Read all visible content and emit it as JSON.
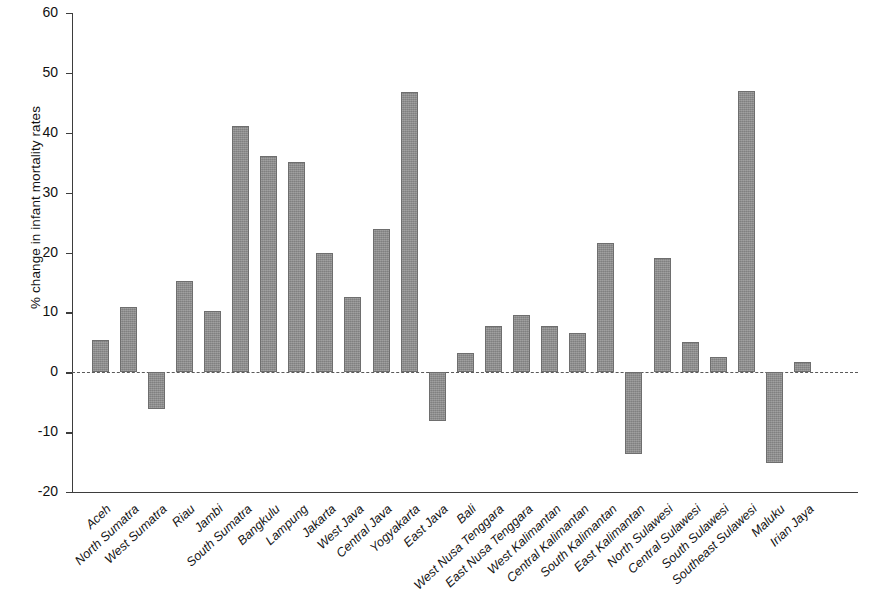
{
  "chart_data": {
    "type": "bar",
    "title": "",
    "subtitle": "",
    "xlabel": "",
    "ylabel": "% change in infant mortality rates",
    "ylim": [
      -20,
      60
    ],
    "ytick_labels": [
      "60",
      "50",
      "40",
      "30",
      "20",
      "10",
      "0",
      "-10",
      "-20"
    ],
    "yticks": [
      60,
      50,
      40,
      30,
      20,
      10,
      0,
      -10,
      -20
    ],
    "grid": false,
    "legend": null,
    "zero_reference_line": true,
    "bar_color": "#8c8c8c",
    "bar_edge_color": "#6e6e6e",
    "axis_color": "#3d3d3d",
    "categories": [
      "Aceh",
      "North Sumatra",
      "West Sumatra",
      "Riau",
      "Jambi",
      "South Sumatra",
      "Bangkulu",
      "Lampung",
      "Jakarta",
      "West Java",
      "Central Java",
      "Yogyakarta",
      "East Java",
      "Bali",
      "West Nusa Tenggara",
      "East Nusa Tenggara",
      "West Kalimantan",
      "Central Kalimantan",
      "South Kalimantan",
      "East Kalimantan",
      "North Sulawesi",
      "Central Sulawesi",
      "South Sulawesi",
      "Southeast Sulawesi",
      "Maluku",
      "Irian Jaya"
    ],
    "values": [
      5.4,
      10.9,
      -6.2,
      15.2,
      10.3,
      41.2,
      36.1,
      35.1,
      19.9,
      12.6,
      23.9,
      46.8,
      -8.1,
      3.2,
      7.8,
      9.6,
      7.8,
      6.5,
      21.6,
      -13.6,
      19.1,
      5.1,
      2.6,
      46.9,
      -15.1,
      1.7
    ]
  }
}
